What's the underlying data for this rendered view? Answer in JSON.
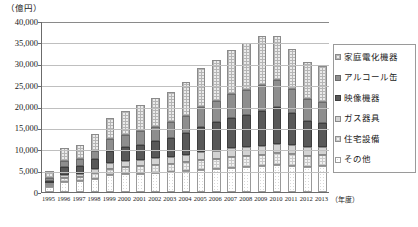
{
  "chart_data": {
    "type": "bar",
    "subtype": "stacked-bar",
    "title": "",
    "unit_label": "（億円）",
    "xlabel": "（年度）",
    "ylabel": "",
    "ylim": [
      0,
      40000
    ],
    "ytick_step": 5000,
    "yticks": [
      "0",
      "5,000",
      "10,000",
      "15,000",
      "20,000",
      "25,000",
      "30,000",
      "35,000",
      "40,000"
    ],
    "ytick_values": [
      0,
      5000,
      10000,
      15000,
      20000,
      25000,
      30000,
      35000,
      40000
    ],
    "grid": true,
    "legend_position": "right",
    "categories": [
      "1995",
      "1996",
      "1997",
      "1998",
      "1999",
      "2000",
      "2001",
      "2002",
      "2003",
      "2004",
      "2005",
      "2006",
      "2007",
      "2008",
      "2009",
      "2010",
      "2011",
      "2012",
      "2013"
    ],
    "series": [
      {
        "name": "その他",
        "values": [
          1100,
          2400,
          2500,
          3100,
          3900,
          4200,
          4300,
          4500,
          4600,
          4900,
          5200,
          5400,
          5700,
          5900,
          6000,
          6300,
          6200,
          5900,
          6000
        ]
      },
      {
        "name": "住宅設備",
        "values": [
          500,
          900,
          1000,
          1300,
          1600,
          1700,
          1800,
          1900,
          2000,
          2100,
          2300,
          2400,
          2500,
          2600,
          2700,
          2800,
          2700,
          2600,
          2600
        ]
      },
      {
        "name": "ガス器具",
        "values": [
          400,
          700,
          800,
          1000,
          1200,
          1300,
          1400,
          1500,
          1600,
          1700,
          1800,
          1900,
          2000,
          2000,
          2100,
          2200,
          2100,
          2000,
          2000
        ]
      },
      {
        "name": "映像機器",
        "values": [
          600,
          1800,
          1900,
          2300,
          3000,
          3300,
          3600,
          4000,
          4400,
          5000,
          6000,
          6600,
          7200,
          7600,
          8200,
          8600,
          7400,
          6200,
          5600
        ]
      },
      {
        "name": "アルコール缶",
        "values": [
          700,
          1500,
          1600,
          2000,
          2600,
          2900,
          3100,
          3400,
          3700,
          4100,
          4700,
          5100,
          5500,
          5800,
          6100,
          6400,
          5700,
          5100,
          4800
        ]
      },
      {
        "name": "家庭電化機器",
        "values": [
          1600,
          3000,
          3200,
          3900,
          5100,
          5600,
          6100,
          6600,
          7200,
          8000,
          9000,
          9600,
          10400,
          10900,
          11400,
          10200,
          9300,
          8700,
          8600
        ]
      }
    ],
    "totals": [
      4900,
      10300,
      11000,
      13600,
      17400,
      19000,
      20300,
      21900,
      23500,
      25800,
      29000,
      31000,
      33300,
      34800,
      36500,
      36500,
      33400,
      30500,
      29600
    ]
  },
  "legend": {
    "items": [
      {
        "label": "家庭電化機器",
        "key": "katei"
      },
      {
        "label": "アルコール缶",
        "key": "alcohol"
      },
      {
        "label": "映像機器",
        "key": "eizou"
      },
      {
        "label": "ガス器具",
        "key": "gas"
      },
      {
        "label": "住宅設備",
        "key": "jutaku"
      },
      {
        "label": "その他",
        "key": "sonota"
      }
    ]
  },
  "colors": {
    "katei": "#ebebeb",
    "alcohol": "#8e8e8e",
    "eizou": "#585858",
    "gas": "#d3d3d3",
    "jutaku": "#f2f2f2",
    "sonota": "#ffffff",
    "axis": "#6b6b6b",
    "grid": "#bfbfbf"
  }
}
